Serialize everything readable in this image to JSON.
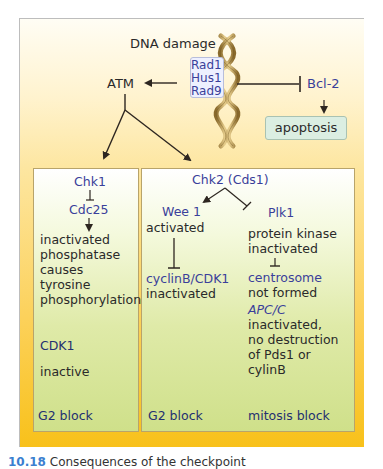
{
  "diagram": {
    "top": {
      "dna_damage": "DNA damage",
      "sensors": [
        "Rad1",
        "Hus1",
        "Rad9"
      ],
      "atm": "ATM",
      "bcl2": "Bcl-2",
      "apoptosis": "apoptosis"
    },
    "left_panel": {
      "chk1": "Chk1",
      "cdc25": "Cdc25",
      "effect_lines": [
        "inactivated",
        "phosphatase",
        "causes",
        "tyrosine",
        "phosphorylation"
      ],
      "cdk1": "CDK1",
      "cdk1_state": "inactive",
      "outcome": "G2 block"
    },
    "right_panel": {
      "chk2": "Chk2 (Cds1)",
      "wee1": {
        "name": "Wee 1",
        "state": "activated",
        "target": "cyclinB/CDK1",
        "target_state": "inactivated",
        "outcome": "G2 block"
      },
      "plk1": {
        "name": "Plk1",
        "state_lines": [
          "protein kinase",
          "inactivated"
        ],
        "target": "centrosome",
        "target_state": "not formed",
        "apc": "APC/C",
        "apc_lines": [
          "inactivated,",
          "no destruction",
          "of Pds1 or",
          "cylinB"
        ],
        "outcome": "mitosis block"
      }
    },
    "colors": {
      "frame_gradient_top": "#fffdf4",
      "frame_gradient_bottom": "#f8c11a",
      "panel_gradient_top": "#ffffff",
      "panel_gradient_bottom": "#cfe08a",
      "protein_text": "#3a3f9a",
      "outcome_text": "#243070",
      "body_text": "#2a2a2a",
      "helix": "#c9a65a"
    }
  },
  "caption": {
    "figure_number": "10.18",
    "text": "Consequences of the checkpoint"
  }
}
